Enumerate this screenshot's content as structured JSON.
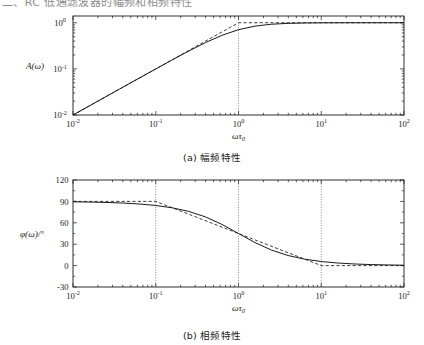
{
  "page": {
    "top_strip_text": "二、RC 低通滤波器的幅频和相频特性"
  },
  "figures": [
    {
      "id": "magnitude",
      "caption": "(a) 幅频特性",
      "ylabel": "A(ω)",
      "xlabel": "ωτ",
      "xlabel_sub": "0",
      "chart_data": {
        "type": "line",
        "title": "(a) 幅频特性",
        "xlabel": "ωτ₀",
        "ylabel": "A(ω)",
        "xscale": "log",
        "yscale": "log",
        "xlim": [
          0.01,
          100
        ],
        "ylim": [
          0.01,
          1.4
        ],
        "xticks": [
          0.01,
          0.1,
          1,
          10,
          100
        ],
        "xticklabels": [
          "10⁻²",
          "10⁻¹",
          "10⁰",
          "10¹",
          "10²"
        ],
        "yticks": [
          0.01,
          0.1,
          1
        ],
        "yticklabels": [
          "10⁻²",
          "10⁻¹",
          "10⁰"
        ],
        "grid": false,
        "legend": false,
        "annotations": [
          {
            "type": "vline",
            "x": 1,
            "style": "dotted",
            "label": "ωτ₀ = 1"
          }
        ],
        "series": [
          {
            "name": "exact",
            "style": "solid",
            "color": "#1a1a1a",
            "x": [
              0.01,
              0.0158,
              0.0251,
              0.0398,
              0.0631,
              0.1,
              0.158,
              0.251,
              0.398,
              0.631,
              1.0,
              1.58,
              2.51,
              3.98,
              6.31,
              10.0,
              15.8,
              25.1,
              39.8,
              63.1,
              100.0
            ],
            "y": [
              0.01,
              0.0158,
              0.0251,
              0.0398,
              0.063,
              0.0995,
              0.1563,
              0.2437,
              0.37,
              0.5333,
              0.7071,
              0.8452,
              0.9292,
              0.9697,
              0.9876,
              0.995,
              0.998,
              0.9992,
              0.9997,
              0.9999,
              1.0
            ]
          },
          {
            "name": "asymptote",
            "style": "dashed",
            "color": "#1a1a1a",
            "x": [
              0.01,
              1.0,
              100.0
            ],
            "y": [
              0.01,
              1.0,
              1.0
            ]
          }
        ]
      }
    },
    {
      "id": "phase",
      "caption": "(b) 相频特性",
      "ylabel": "φ(ω)/°",
      "xlabel": "ωτ",
      "xlabel_sub": "0",
      "chart_data": {
        "type": "line",
        "title": "(b) 相频特性",
        "xlabel": "ωτ₀",
        "ylabel": "φ(ω)/°",
        "xscale": "log",
        "yscale": "linear",
        "xlim": [
          0.01,
          100
        ],
        "ylim": [
          -30,
          120
        ],
        "xticks": [
          0.01,
          0.1,
          1,
          10,
          100
        ],
        "xticklabels": [
          "10⁻²",
          "10⁻¹",
          "10⁰",
          "10¹",
          "10²"
        ],
        "yticks": [
          -30,
          0,
          30,
          60,
          90,
          120
        ],
        "yticklabels": [
          "-30",
          "0",
          "30",
          "60",
          "90",
          "120"
        ],
        "grid": false,
        "legend": false,
        "annotations": [
          {
            "type": "vline",
            "x": 0.1,
            "style": "dotted"
          },
          {
            "type": "vline",
            "x": 1,
            "style": "dotted"
          },
          {
            "type": "vline",
            "x": 10,
            "style": "dotted"
          }
        ],
        "series": [
          {
            "name": "exact",
            "style": "solid",
            "color": "#1a1a1a",
            "x": [
              0.01,
              0.0158,
              0.0251,
              0.0398,
              0.0631,
              0.1,
              0.158,
              0.251,
              0.398,
              0.631,
              1.0,
              1.58,
              2.51,
              3.98,
              6.31,
              10.0,
              15.8,
              25.1,
              39.8,
              63.1,
              100.0
            ],
            "y": [
              89.43,
              89.09,
              88.56,
              87.72,
              86.39,
              84.29,
              81.01,
              75.93,
              68.31,
              57.74,
              45.0,
              32.3,
              21.7,
              14.1,
              9.0,
              5.71,
              3.62,
              2.28,
              1.44,
              0.91,
              0.57
            ]
          },
          {
            "name": "asymptote",
            "style": "dashed",
            "color": "#1a1a1a",
            "x": [
              0.01,
              0.1,
              1.0,
              10.0,
              100.0
            ],
            "y": [
              90.0,
              90.0,
              45.0,
              0.0,
              0.0
            ]
          }
        ]
      }
    }
  ]
}
